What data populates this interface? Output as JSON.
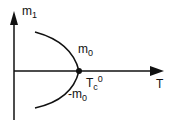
{
  "diagram": {
    "y_axis": {
      "label_main": "m",
      "label_sub": "1"
    },
    "x_axis": {
      "label": "T"
    },
    "curve_upper": {
      "label_main": "m",
      "label_sub": "0"
    },
    "curve_lower": {
      "label_main": "-m",
      "label_sub": "0"
    },
    "critical_point": {
      "label_main": "T",
      "label_sub": "c",
      "label_sup": "0"
    },
    "colors": {
      "ink": "#111111",
      "background": "#ffffff"
    }
  }
}
